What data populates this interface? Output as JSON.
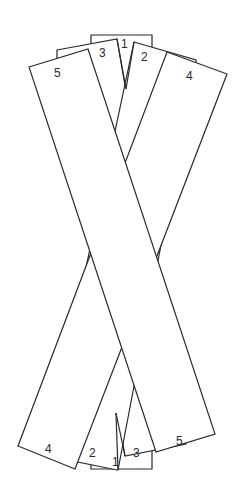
{
  "diagram": {
    "title": "",
    "colors": {
      "stroke": "#2a2a2a",
      "fill": "#ffffff",
      "background": "#ffffff"
    },
    "top_labels": [
      {
        "id": "1",
        "text": "1",
        "x": 121,
        "y": 48
      },
      {
        "id": "3",
        "text": "3",
        "x": 99,
        "y": 57
      },
      {
        "id": "2",
        "text": "2",
        "x": 141,
        "y": 61
      },
      {
        "id": "5",
        "text": "5",
        "x": 54,
        "y": 77
      },
      {
        "id": "4",
        "text": "4",
        "x": 186,
        "y": 80
      }
    ],
    "bottom_labels": [
      {
        "id": "4",
        "text": "4",
        "x": 45,
        "y": 453
      },
      {
        "id": "2",
        "text": "2",
        "x": 89,
        "y": 457
      },
      {
        "id": "1",
        "text": "1",
        "x": 112,
        "y": 462
      },
      {
        "id": "3",
        "text": "3",
        "x": 133,
        "y": 457
      },
      {
        "id": "5",
        "text": "5",
        "x": 176,
        "y": 445
      }
    ]
  }
}
